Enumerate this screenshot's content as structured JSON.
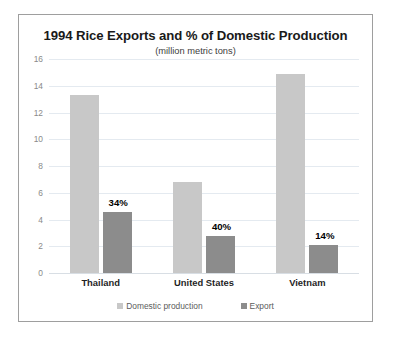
{
  "chart_data": {
    "type": "bar",
    "title": "1994 Rice Exports and % of Domestic Production",
    "subtitle": "(million metric tons)",
    "xlabel": "",
    "ylabel": "",
    "ylim": [
      0,
      16
    ],
    "ytick_step": 2,
    "yticks": [
      "0",
      "2",
      "4",
      "6",
      "8",
      "10",
      "12",
      "14",
      "16"
    ],
    "grid": "horizontal",
    "legend_position": "bottom",
    "categories": [
      "Thailand",
      "United States",
      "Vietnam"
    ],
    "series": [
      {
        "name": "Domestic production",
        "color": "#c8c8c8",
        "values": [
          13.3,
          6.8,
          14.9
        ]
      },
      {
        "name": "Export",
        "color": "#8c8c8c",
        "values": [
          4.55,
          2.75,
          2.1
        ]
      }
    ],
    "annotations": [
      "34%",
      "40%",
      "14%"
    ]
  },
  "colors": {
    "domestic_production": "#c8c8c8",
    "export": "#8c8c8c",
    "gridline": "#e4eaf0",
    "frame_border": "#9e9e9e",
    "label_text": "#000000"
  }
}
